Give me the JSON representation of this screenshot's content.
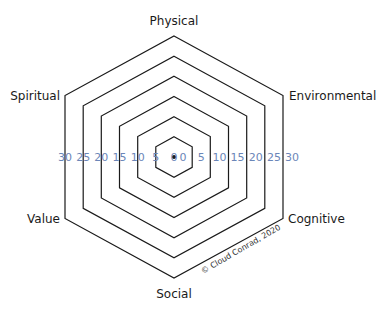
{
  "chart_data": {
    "type": "radar",
    "title": "",
    "axes": [
      "Physical",
      "Environmental",
      "Cognitive",
      "Social",
      "Value",
      "Spiritual"
    ],
    "rings": [
      0,
      5,
      10,
      15,
      20,
      25,
      30
    ],
    "scale_labels_left": [
      "30",
      "25",
      "20",
      "15",
      "10",
      "5",
      "0"
    ],
    "scale_labels_right": [
      "0",
      "5",
      "10",
      "15",
      "20",
      "25",
      "30"
    ],
    "range": [
      0,
      30
    ],
    "grid": true,
    "series": []
  },
  "labels": {
    "physical": "Physical",
    "environmental": "Environmental",
    "cognitive": "Cognitive",
    "social": "Social",
    "value": "Value",
    "spiritual": "Spiritual"
  },
  "copyright": "© Cloud Conrad, 2020",
  "colors": {
    "grid": "#1a1a1a",
    "scale": "#6b86b8",
    "text": "#1a1a1a",
    "background": "#ffffff"
  }
}
